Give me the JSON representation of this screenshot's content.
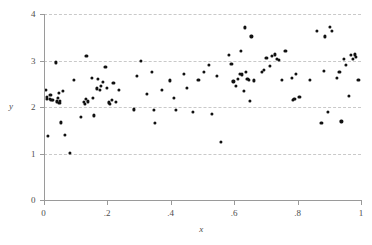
{
  "chart_data": {
    "type": "scatter",
    "title": "",
    "subtitle": "",
    "xlabel": "x",
    "ylabel": "y",
    "xlim": [
      0,
      1
    ],
    "ylim": [
      0,
      4
    ],
    "xticks": [
      0,
      0.2,
      0.4,
      0.6,
      0.8,
      1
    ],
    "xticklabels": [
      "0",
      ".2",
      ".4",
      ".6",
      ".8",
      "1"
    ],
    "yticks": [
      0,
      1,
      2,
      3,
      4
    ],
    "yticklabels": [
      "0",
      "1",
      "2",
      "3",
      "4"
    ],
    "grid": {
      "horizontal": true,
      "vertical": false,
      "style": "dashed",
      "color": "#c9c9c9"
    },
    "legend": null,
    "marker": {
      "shape": "circle",
      "color": "#111111",
      "size": 3.2
    },
    "series": [
      {
        "name": "observations",
        "points": [
          [
            0.008,
            2.36
          ],
          [
            0.01,
            2.18
          ],
          [
            0.012,
            2.21
          ],
          [
            0.014,
            1.38
          ],
          [
            0.02,
            2.17
          ],
          [
            0.022,
            2.26
          ],
          [
            0.025,
            2.15
          ],
          [
            0.03,
            2.16
          ],
          [
            0.038,
            2.96
          ],
          [
            0.042,
            2.12
          ],
          [
            0.045,
            2.19
          ],
          [
            0.048,
            2.3
          ],
          [
            0.05,
            2.08
          ],
          [
            0.052,
            2.13
          ],
          [
            0.055,
            1.67
          ],
          [
            0.062,
            2.35
          ],
          [
            0.068,
            1.4
          ],
          [
            0.082,
            1.02
          ],
          [
            0.095,
            2.59
          ],
          [
            0.118,
            1.79
          ],
          [
            0.128,
            2.11
          ],
          [
            0.13,
            2.07
          ],
          [
            0.133,
            2.17
          ],
          [
            0.135,
            3.1
          ],
          [
            0.14,
            2.12
          ],
          [
            0.152,
            2.63
          ],
          [
            0.155,
            2.2
          ],
          [
            0.16,
            1.82
          ],
          [
            0.168,
            2.4
          ],
          [
            0.172,
            2.61
          ],
          [
            0.178,
            2.37
          ],
          [
            0.182,
            2.46
          ],
          [
            0.188,
            2.54
          ],
          [
            0.195,
            2.86
          ],
          [
            0.2,
            2.41
          ],
          [
            0.205,
            2.1
          ],
          [
            0.21,
            2.06
          ],
          [
            0.215,
            2.16
          ],
          [
            0.22,
            2.52
          ],
          [
            0.228,
            2.11
          ],
          [
            0.238,
            2.37
          ],
          [
            0.285,
            1.95
          ],
          [
            0.295,
            2.66
          ],
          [
            0.308,
            2.99
          ],
          [
            0.325,
            2.28
          ],
          [
            0.342,
            2.76
          ],
          [
            0.348,
            1.94
          ],
          [
            0.352,
            1.66
          ],
          [
            0.372,
            2.37
          ],
          [
            0.398,
            2.57
          ],
          [
            0.412,
            2.2
          ],
          [
            0.418,
            1.94
          ],
          [
            0.442,
            2.72
          ],
          [
            0.452,
            2.41
          ],
          [
            0.47,
            1.9
          ],
          [
            0.488,
            2.58
          ],
          [
            0.505,
            2.76
          ],
          [
            0.52,
            2.9
          ],
          [
            0.53,
            1.85
          ],
          [
            0.545,
            2.66
          ],
          [
            0.558,
            1.25
          ],
          [
            0.585,
            3.12
          ],
          [
            0.592,
            2.92
          ],
          [
            0.598,
            2.55
          ],
          [
            0.605,
            2.46
          ],
          [
            0.612,
            2.6
          ],
          [
            0.618,
            2.71
          ],
          [
            0.622,
            3.2
          ],
          [
            0.626,
            2.7
          ],
          [
            0.63,
            2.35
          ],
          [
            0.634,
            3.71
          ],
          [
            0.638,
            2.76
          ],
          [
            0.642,
            2.6
          ],
          [
            0.646,
            2.58
          ],
          [
            0.65,
            2.13
          ],
          [
            0.655,
            3.52
          ],
          [
            0.662,
            2.57
          ],
          [
            0.688,
            2.76
          ],
          [
            0.695,
            2.8
          ],
          [
            0.702,
            3.05
          ],
          [
            0.712,
            2.88
          ],
          [
            0.72,
            3.1
          ],
          [
            0.728,
            3.13
          ],
          [
            0.736,
            3.04
          ],
          [
            0.742,
            3.02
          ],
          [
            0.752,
            2.58
          ],
          [
            0.762,
            3.21
          ],
          [
            0.782,
            2.62
          ],
          [
            0.786,
            2.16
          ],
          [
            0.79,
            2.17
          ],
          [
            0.796,
            2.72
          ],
          [
            0.806,
            2.22
          ],
          [
            0.838,
            2.58
          ],
          [
            0.862,
            3.64
          ],
          [
            0.875,
            1.65
          ],
          [
            0.882,
            2.77
          ],
          [
            0.886,
            3.52
          ],
          [
            0.895,
            1.89
          ],
          [
            0.902,
            3.73
          ],
          [
            0.908,
            3.64
          ],
          [
            0.925,
            2.63
          ],
          [
            0.932,
            2.76
          ],
          [
            0.938,
            1.69
          ],
          [
            0.945,
            3.04
          ],
          [
            0.952,
            2.9
          ],
          [
            0.962,
            2.24
          ],
          [
            0.968,
            3.12
          ],
          [
            0.975,
            3.04
          ],
          [
            0.98,
            3.13
          ],
          [
            0.985,
            3.08
          ],
          [
            0.992,
            2.58
          ]
        ]
      }
    ]
  },
  "axes": {
    "x_title": "x",
    "y_title": "y"
  }
}
